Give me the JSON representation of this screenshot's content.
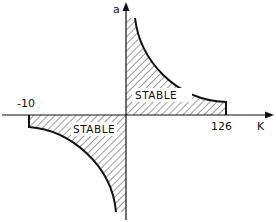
{
  "diagram": {
    "title": "",
    "axes": {
      "x_label": "K",
      "y_label": "a",
      "x_ticks": [
        {
          "label": "-10",
          "value": -10
        },
        {
          "label": "126",
          "value": 126
        }
      ]
    },
    "regions": [
      {
        "label": "STABLE",
        "quadrant": "upper-right",
        "k_range": [
          0,
          126
        ],
        "hatched": true
      },
      {
        "label": "STABLE",
        "quadrant": "lower-left",
        "k_range": [
          -10,
          0
        ],
        "hatched": true
      }
    ],
    "colors": {
      "ink": "#111111",
      "background": "#ffffff"
    }
  }
}
